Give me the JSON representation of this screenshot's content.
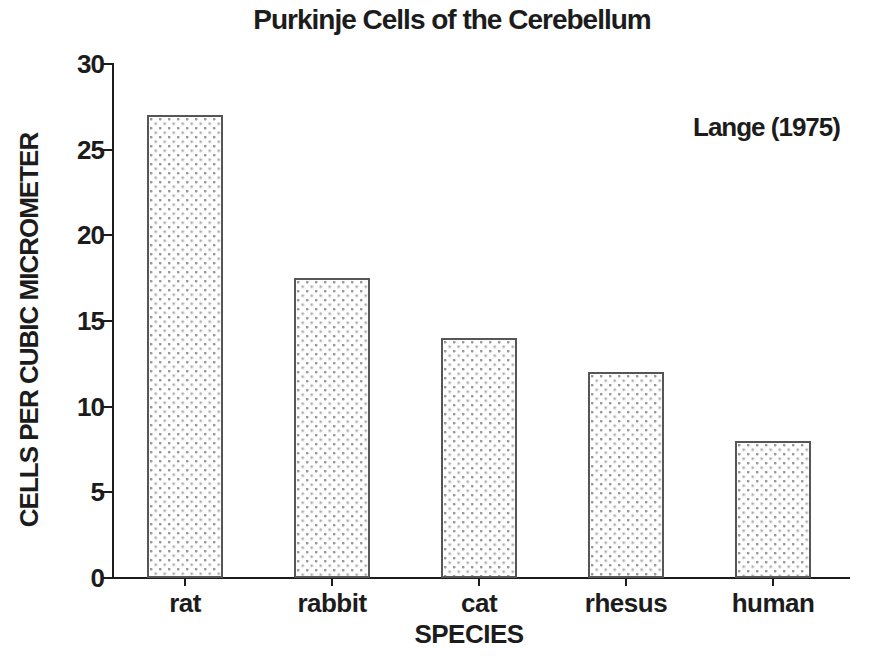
{
  "chart_data": {
    "type": "bar",
    "title": "Purkinje Cells of the Cerebellum",
    "annotation": "Lange (1975)",
    "xlabel": "SPECIES",
    "ylabel": "CELLS PER CUBIC MICROMETER",
    "categories": [
      "rat",
      "rabbit",
      "cat",
      "rhesus",
      "human"
    ],
    "values": [
      27,
      17.5,
      14,
      12,
      8
    ],
    "ylim": [
      0,
      30
    ],
    "yticks": [
      0,
      5,
      10,
      15,
      20,
      25,
      30
    ],
    "grid": false,
    "legend": "none",
    "bar_style": {
      "fill": "#fefefe",
      "pattern": "stipple-dots",
      "dot_color": "#9a9a9a",
      "outline_color": "#565656"
    },
    "ink_color": "#1c1c1c",
    "background": "#ffffff"
  }
}
